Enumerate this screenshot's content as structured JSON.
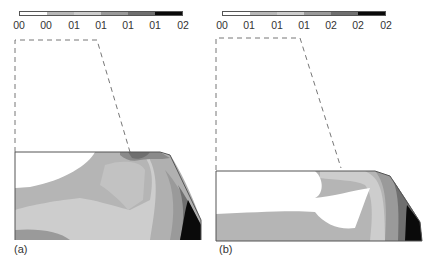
{
  "figure": {
    "panels": [
      {
        "id": "a",
        "caption": "(a)",
        "legend": {
          "tick_labels": [
            "00",
            "00",
            "01",
            "01",
            "01",
            "01",
            "02"
          ],
          "colors": [
            "#ffffff",
            "#b8b8b8",
            "#cdcdcd",
            "#9a9a9a",
            "#6f6f6f",
            "#0a0a0a"
          ]
        }
      },
      {
        "id": "b",
        "caption": "(b)",
        "legend": {
          "tick_labels": [
            "00",
            "01",
            "01",
            "01",
            "02",
            "02",
            "02"
          ],
          "colors": [
            "#ffffff",
            "#b8b8b8",
            "#cdcdcd",
            "#9a9a9a",
            "#6f6f6f",
            "#0a0a0a"
          ]
        }
      }
    ],
    "colors": {
      "contour_light": "#cdcdcd",
      "contour_mid_light": "#b5b5b5",
      "contour_mid": "#9a9a9a",
      "contour_dark": "#6f6f6f",
      "contour_black": "#0a0a0a",
      "outline": "#555555",
      "dashed_outline": "#777777"
    }
  }
}
